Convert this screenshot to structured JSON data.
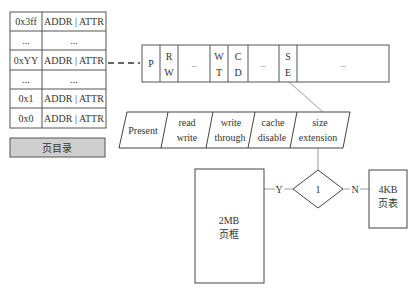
{
  "page_directory": {
    "rows": [
      {
        "index": "0x3ff",
        "value": "ADDR | ATTR"
      },
      {
        "index": "...",
        "value": "..."
      },
      {
        "index": "0xYY",
        "value": "ADDR | ATTR"
      },
      {
        "index": "...",
        "value": "..."
      },
      {
        "index": "0x1",
        "value": "ADDR | ATTR"
      },
      {
        "index": "0x0",
        "value": "ADDR | ATTR"
      }
    ],
    "label": "页目录",
    "label_bg": "#cfcfcf"
  },
  "entry_bits": [
    {
      "top": "P",
      "bottom": ""
    },
    {
      "top": "R",
      "bottom": "W"
    },
    {
      "top": "...",
      "bottom": ""
    },
    {
      "top": "W",
      "bottom": "T"
    },
    {
      "top": "C",
      "bottom": "D"
    },
    {
      "top": "...",
      "bottom": ""
    },
    {
      "top": "S",
      "bottom": "E"
    },
    {
      "top": "...",
      "bottom": ""
    }
  ],
  "flags": [
    {
      "line1": "Present",
      "line2": ""
    },
    {
      "line1": "read",
      "line2": "write"
    },
    {
      "line1": "write",
      "line2": "through"
    },
    {
      "line1": "cache",
      "line2": "disable"
    },
    {
      "line1": "size",
      "line2": "extension"
    }
  ],
  "decision": {
    "value": "1",
    "yes_label": "Y",
    "no_label": "N"
  },
  "page_frame_2mb": {
    "line1": "2MB",
    "line2": "页框"
  },
  "page_table_4kb": {
    "line1": "4KB",
    "line2": "页表"
  }
}
